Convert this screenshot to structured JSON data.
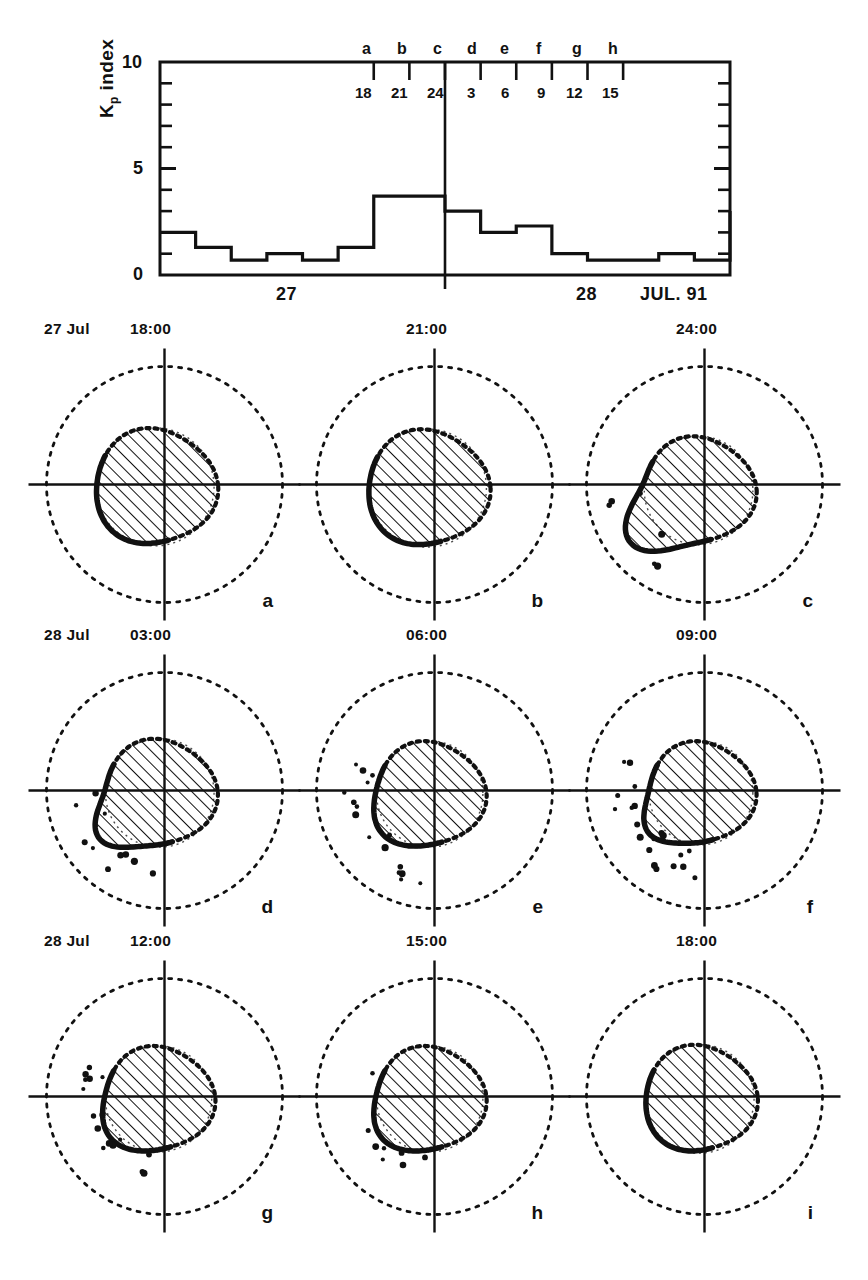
{
  "figure": {
    "ink_color": "#111111"
  },
  "kp_panel": {
    "ylabel_main": "index",
    "ylabel_symbol": "K",
    "ylabel_sub": "p",
    "y_ticks": [
      "10",
      "5",
      "0"
    ],
    "marker_letters": [
      "a",
      "b",
      "c",
      "d",
      "e",
      "f",
      "g",
      "h"
    ],
    "hour_labels": [
      "18",
      "21",
      "24",
      "3",
      "6",
      "9",
      "12",
      "15"
    ],
    "day_labels": [
      "27",
      "28"
    ],
    "month_year_label": "JUL. 91"
  },
  "chart_data": {
    "type": "bar",
    "title": "Kp index",
    "xlabel": "JUL. 91",
    "ylabel": "Kp index",
    "ylim": [
      0,
      10
    ],
    "ytick_values": [
      0,
      5,
      10
    ],
    "minor_tick_values": [
      1,
      2,
      3,
      4,
      6,
      7,
      8,
      9
    ],
    "grid": false,
    "legend": "none",
    "x_note": "Sixteen 3-hour UT intervals spanning 27 and 28 July 1991",
    "categories": [
      "27 00-03",
      "27 03-06",
      "27 06-09",
      "27 09-12",
      "27 12-15",
      "27 15-18",
      "27 18-21",
      "27 21-24",
      "28 00-03",
      "28 03-06",
      "28 06-09",
      "28 09-12",
      "28 12-15",
      "28 15-18",
      "28 18-21",
      "28 21-24"
    ],
    "values": [
      2.0,
      1.3,
      0.7,
      1.0,
      0.7,
      1.3,
      3.7,
      3.7,
      3.0,
      2.0,
      2.3,
      1.0,
      0.7,
      0.7,
      1.0,
      0.7
    ],
    "tail_value": 3.0,
    "marker_hours": [
      18,
      21,
      24,
      3,
      6,
      9,
      12,
      15
    ],
    "marker_letters": [
      "a",
      "b",
      "c",
      "d",
      "e",
      "f",
      "g",
      "h"
    ],
    "day_boundary_hour": 24
  },
  "plots": [
    {
      "id": "a",
      "date": "27 Jul",
      "time": "18:00",
      "label": "a",
      "oval_offset_x": -0.08,
      "oval_offset_y": 0.02,
      "oval_radius": 0.5,
      "bulge": "none"
    },
    {
      "id": "b",
      "date": "",
      "time": "21:00",
      "label": "b",
      "oval_offset_x": -0.06,
      "oval_offset_y": 0.03,
      "oval_radius": 0.5,
      "bulge": "none"
    },
    {
      "id": "c",
      "date": "",
      "time": "24:00",
      "label": "c",
      "oval_offset_x": -0.05,
      "oval_offset_y": 0.05,
      "oval_radius": 0.46,
      "bulge": "lower-left"
    },
    {
      "id": "d",
      "date": "28 Jul",
      "time": "03:00",
      "label": "d",
      "oval_offset_x": -0.04,
      "oval_offset_y": 0.02,
      "oval_radius": 0.46,
      "bulge": "lower-left-tail"
    },
    {
      "id": "e",
      "date": "",
      "time": "06:00",
      "label": "e",
      "oval_offset_x": -0.04,
      "oval_offset_y": 0.03,
      "oval_radius": 0.45,
      "bulge": "lower-scatter"
    },
    {
      "id": "f",
      "date": "",
      "time": "09:00",
      "label": "f",
      "oval_offset_x": -0.03,
      "oval_offset_y": 0.02,
      "oval_radius": 0.44,
      "bulge": "lower-left-scatter"
    },
    {
      "id": "g",
      "date": "28 Jul",
      "time": "12:00",
      "label": "g",
      "oval_offset_x": -0.05,
      "oval_offset_y": 0.02,
      "oval_radius": 0.45,
      "bulge": "lower-scatter"
    },
    {
      "id": "h",
      "date": "",
      "time": "15:00",
      "label": "h",
      "oval_offset_x": -0.04,
      "oval_offset_y": 0.02,
      "oval_radius": 0.45,
      "bulge": "lower-scatter-small"
    },
    {
      "id": "i",
      "date": "",
      "time": "18:00",
      "label": "i",
      "oval_offset_x": -0.04,
      "oval_offset_y": 0.02,
      "oval_radius": 0.46,
      "bulge": "none"
    }
  ]
}
